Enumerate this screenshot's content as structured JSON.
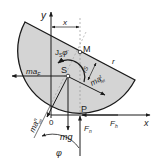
{
  "diagram": {
    "colors": {
      "body_fill": "#d4d4d4",
      "stroke": "#1a1a1a",
      "dashed": "#999999",
      "background": "#ffffff"
    },
    "labels": {
      "y_axis": "y",
      "x_axis": "x",
      "x_dim": "x",
      "origin": "0",
      "point_M": "M",
      "point_S": "S",
      "point_P": "P",
      "radius": "r",
      "rs": "rS",
      "moment_J": "J",
      "moment_J_sub": "S",
      "moment_phi": "φ̈",
      "inertia_force_left": "ma",
      "inertia_force_left_sub": "F",
      "inertia_rel_t": "ma",
      "inertia_rel_t_sup": "t",
      "inertia_rel_t_sub": "rel",
      "inertia_rel_n": "ma",
      "inertia_rel_n_sup": "n",
      "inertia_rel_n_sub": "rel",
      "weight": "mg",
      "normal_force": "F",
      "normal_force_sub": "n",
      "friction_force": "F",
      "friction_force_sub": "h",
      "angle": "φ"
    }
  }
}
